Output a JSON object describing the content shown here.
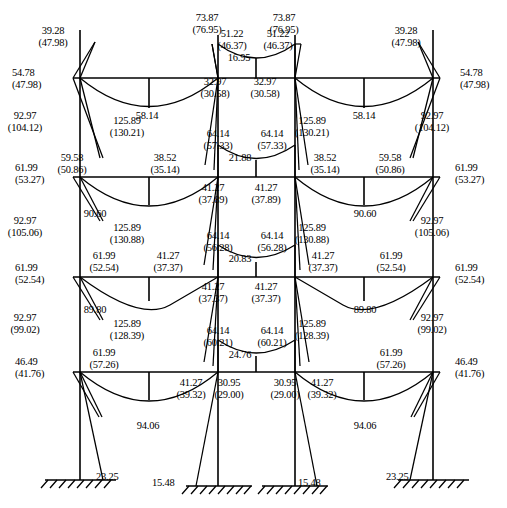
{
  "diagram": {
    "type": "bending-moment-diagram",
    "units": "kN-m",
    "geometry": {
      "columns_x": [
        80,
        218,
        295,
        433
      ],
      "floor_levels_y": [
        78,
        177,
        277,
        372
      ],
      "ground_y": [
        480,
        486,
        486,
        480
      ],
      "canvas": [
        507,
        508
      ]
    },
    "color": "#000000"
  },
  "labels": [
    {
      "id": "l-roof-left-ext-top",
      "text": "54.78\n(47.98)",
      "x": 12,
      "y": 67,
      "align": "left"
    },
    {
      "id": "l-roof-left-col-top",
      "text": "39.28\n(47.98)",
      "x": 53,
      "y": 25,
      "align": "center"
    },
    {
      "id": "l-roof-bay1-mid",
      "text": "58.14",
      "x": 147,
      "y": 110,
      "align": "center"
    },
    {
      "id": "l-roof-c2-top",
      "text": "73.87\n(76.95)",
      "x": 207,
      "y": 12,
      "align": "center"
    },
    {
      "id": "l-roof-c2-right",
      "text": "51.22\n(46.37)",
      "x": 232,
      "y": 28,
      "align": "center"
    },
    {
      "id": "l-roof-c3-left",
      "text": "51.22\n(46.37)",
      "x": 278,
      "y": 28,
      "align": "center"
    },
    {
      "id": "l-roof-midbay-sag",
      "text": "16.95",
      "x": 239,
      "y": 52,
      "align": "center"
    },
    {
      "id": "l-roof-c3-top",
      "text": "73.87\n(76.95)",
      "x": 284,
      "y": 12,
      "align": "center"
    },
    {
      "id": "l-roof-right-col-top",
      "text": "39.28\n(47.98)",
      "x": 406,
      "y": 25,
      "align": "center"
    },
    {
      "id": "l-roof-bay3-mid",
      "text": "58.14",
      "x": 364,
      "y": 110,
      "align": "center"
    },
    {
      "id": "l-roof-right-ext-top",
      "text": "54.78\n(47.98)",
      "x": 460,
      "y": 67,
      "align": "left"
    },
    {
      "id": "l-c2-below-roof",
      "text": "32.97\n(30.58)",
      "x": 215,
      "y": 76,
      "align": "center"
    },
    {
      "id": "l-c3-below-roof",
      "text": "32.97\n(30.58)",
      "x": 265,
      "y": 76,
      "align": "center"
    },
    {
      "id": "l-f2-c1-above",
      "text": "92.97\n(104.12)",
      "x": 25,
      "y": 110,
      "align": "center"
    },
    {
      "id": "l-f2-c2-above",
      "text": "125.89\n(130.21)",
      "x": 127,
      "y": 115,
      "align": "center"
    },
    {
      "id": "l-f2-c3-above",
      "text": "125.89\n(130.21)",
      "x": 312,
      "y": 115,
      "align": "center"
    },
    {
      "id": "l-f2-c4-above",
      "text": "92.97\n(104.12)",
      "x": 432,
      "y": 110,
      "align": "center"
    },
    {
      "id": "l-f2-left-ext",
      "text": "61.99\n(53.27)",
      "x": 15,
      "y": 162,
      "align": "left"
    },
    {
      "id": "l-f2-beam-left",
      "text": "59.58\n(50.86)",
      "x": 72,
      "y": 152,
      "align": "center"
    },
    {
      "id": "l-f2-beam-right1",
      "text": "38.52\n(35.14)",
      "x": 165,
      "y": 152,
      "align": "center"
    },
    {
      "id": "l-f2-mid-c2",
      "text": "64.14\n(57.33)",
      "x": 218,
      "y": 128,
      "align": "center"
    },
    {
      "id": "l-f2-mid-c3",
      "text": "64.14\n(57.33)",
      "x": 272,
      "y": 128,
      "align": "center"
    },
    {
      "id": "l-f2-mid-sag",
      "text": "21.88",
      "x": 240,
      "y": 152,
      "align": "center"
    },
    {
      "id": "l-f2-beam-right2",
      "text": "38.52\n(35.14)",
      "x": 325,
      "y": 152,
      "align": "center"
    },
    {
      "id": "l-f2-beam-right3",
      "text": "59.58\n(50.86)",
      "x": 390,
      "y": 152,
      "align": "center"
    },
    {
      "id": "l-f2-right-ext",
      "text": "61.99\n(53.27)",
      "x": 455,
      "y": 162,
      "align": "left"
    },
    {
      "id": "l-f2-bay1-mid",
      "text": "90.60",
      "x": 95,
      "y": 208,
      "align": "center"
    },
    {
      "id": "l-f2-bay3-mid",
      "text": "90.60",
      "x": 365,
      "y": 208,
      "align": "center"
    },
    {
      "id": "l-f2-c2-below",
      "text": "41.27\n(37.89)",
      "x": 213,
      "y": 182,
      "align": "center"
    },
    {
      "id": "l-f2-c3-below",
      "text": "41.27\n(37.89)",
      "x": 266,
      "y": 182,
      "align": "center"
    },
    {
      "id": "l-f3-c1-above",
      "text": "92.97\n(105.06)",
      "x": 25,
      "y": 215,
      "align": "center"
    },
    {
      "id": "l-f3-c2-above",
      "text": "125.89\n(130.88)",
      "x": 127,
      "y": 222,
      "align": "center"
    },
    {
      "id": "l-f3-c3-above",
      "text": "125.89\n(130.88)",
      "x": 312,
      "y": 222,
      "align": "center"
    },
    {
      "id": "l-f3-c4-above",
      "text": "92.97\n(105.06)",
      "x": 432,
      "y": 215,
      "align": "center"
    },
    {
      "id": "l-f3-left-ext",
      "text": "61.99\n(52.54)",
      "x": 15,
      "y": 262,
      "align": "left"
    },
    {
      "id": "l-f3-beam-left",
      "text": "61.99\n(52.54)",
      "x": 104,
      "y": 250,
      "align": "center"
    },
    {
      "id": "l-f3-beam-right1",
      "text": "41.27\n(37.37)",
      "x": 168,
      "y": 250,
      "align": "center"
    },
    {
      "id": "l-f3-mid-c2",
      "text": "64.14\n(56.28)",
      "x": 218,
      "y": 230,
      "align": "center"
    },
    {
      "id": "l-f3-mid-c3",
      "text": "64.14\n(56.28)",
      "x": 272,
      "y": 230,
      "align": "center"
    },
    {
      "id": "l-f3-mid-sag",
      "text": "20.83",
      "x": 240,
      "y": 253,
      "align": "center"
    },
    {
      "id": "l-f3-beam-right2",
      "text": "41.27\n(37.37)",
      "x": 323,
      "y": 250,
      "align": "center"
    },
    {
      "id": "l-f3-beam-right3",
      "text": "61.99\n(52.54)",
      "x": 391,
      "y": 250,
      "align": "center"
    },
    {
      "id": "l-f3-right-ext",
      "text": "61.99\n(52.54)",
      "x": 455,
      "y": 262,
      "align": "left"
    },
    {
      "id": "l-f3-bay1-mid",
      "text": "89.80",
      "x": 95,
      "y": 304,
      "align": "center"
    },
    {
      "id": "l-f3-bay3-mid",
      "text": "89.80",
      "x": 365,
      "y": 304,
      "align": "center"
    },
    {
      "id": "l-f3-c2-below",
      "text": "41.27\n(37.37)",
      "x": 213,
      "y": 281,
      "align": "center"
    },
    {
      "id": "l-f3-c3-below",
      "text": "41.27\n(37.37)",
      "x": 266,
      "y": 281,
      "align": "center"
    },
    {
      "id": "l-f4-c1-above",
      "text": "92.97\n(99.02)",
      "x": 25,
      "y": 312,
      "align": "center"
    },
    {
      "id": "l-f4-c2-above",
      "text": "125.89\n(128.39)",
      "x": 127,
      "y": 318,
      "align": "center"
    },
    {
      "id": "l-f4-c3-above",
      "text": "125.89\n(128.39)",
      "x": 312,
      "y": 318,
      "align": "center"
    },
    {
      "id": "l-f4-c4-above",
      "text": "92.97\n(99.02)",
      "x": 432,
      "y": 312,
      "align": "center"
    },
    {
      "id": "l-f4-left-ext",
      "text": "46.49\n(41.76)",
      "x": 15,
      "y": 356,
      "align": "left"
    },
    {
      "id": "l-f4-beam-left",
      "text": "61.99\n(57.26)",
      "x": 104,
      "y": 347,
      "align": "center"
    },
    {
      "id": "l-f4-mid-c2",
      "text": "64.14\n(60.21)",
      "x": 218,
      "y": 325,
      "align": "center"
    },
    {
      "id": "l-f4-mid-c3",
      "text": "64.14\n(60.21)",
      "x": 272,
      "y": 325,
      "align": "center"
    },
    {
      "id": "l-f4-mid-sag",
      "text": "24.76",
      "x": 240,
      "y": 349,
      "align": "center"
    },
    {
      "id": "l-f4-beam-right3",
      "text": "61.99\n(57.26)",
      "x": 391,
      "y": 347,
      "align": "center"
    },
    {
      "id": "l-f4-right-ext",
      "text": "46.49\n(41.76)",
      "x": 455,
      "y": 356,
      "align": "left"
    },
    {
      "id": "l-f4-c2l-below",
      "text": "41.27\n(39.32)",
      "x": 191,
      "y": 377,
      "align": "center"
    },
    {
      "id": "l-f4-c2-below",
      "text": "30.95\n(29.00)",
      "x": 229,
      "y": 377,
      "align": "center"
    },
    {
      "id": "l-f4-c3-below",
      "text": "30.95\n(29.00)",
      "x": 285,
      "y": 377,
      "align": "center"
    },
    {
      "id": "l-f4-c3r-below",
      "text": "41.27\n(39.32)",
      "x": 322,
      "y": 377,
      "align": "center"
    },
    {
      "id": "l-f4-bay1-mid",
      "text": "94.06",
      "x": 148,
      "y": 420,
      "align": "center"
    },
    {
      "id": "l-f4-bay3-mid",
      "text": "94.06",
      "x": 365,
      "y": 420,
      "align": "center"
    },
    {
      "id": "l-base-c1",
      "text": "23.25",
      "x": 96,
      "y": 471,
      "align": "left"
    },
    {
      "id": "l-base-c2",
      "text": "15.48",
      "x": 152,
      "y": 477,
      "align": "left"
    },
    {
      "id": "l-base-c3",
      "text": "15.48",
      "x": 298,
      "y": 477,
      "align": "left"
    },
    {
      "id": "l-base-c4",
      "text": "23.25",
      "x": 386,
      "y": 471,
      "align": "left"
    }
  ],
  "chart_data": {
    "type": "line",
    "xlabel": "Frame span",
    "ylabel": "Bending moment (kN-m)",
    "series": [
      {
        "name": "Roof level",
        "points": [
          {
            "loc": "left-exterior-joint",
            "value": 54.78,
            "alt": 47.98
          },
          {
            "loc": "col1-top",
            "value": 39.28,
            "alt": 47.98
          },
          {
            "loc": "bay1-midspan",
            "value": 58.14,
            "alt": null
          },
          {
            "loc": "col2-top",
            "value": 73.87,
            "alt": 76.95
          },
          {
            "loc": "col2-right-mid-bay",
            "value": 51.22,
            "alt": 46.37
          },
          {
            "loc": "mid-bay-sag",
            "value": 16.95,
            "alt": null
          },
          {
            "loc": "col3-left-mid-bay",
            "value": 51.22,
            "alt": 46.37
          },
          {
            "loc": "col3-top",
            "value": 73.87,
            "alt": 76.95
          },
          {
            "loc": "bay3-midspan",
            "value": 58.14,
            "alt": null
          },
          {
            "loc": "col4-top",
            "value": 39.28,
            "alt": 47.98
          },
          {
            "loc": "right-exterior-joint",
            "value": 54.78,
            "alt": 47.98
          },
          {
            "loc": "col2-below-roof",
            "value": 32.97,
            "alt": 30.58
          },
          {
            "loc": "col3-below-roof",
            "value": 32.97,
            "alt": 30.58
          }
        ]
      },
      {
        "name": "Floor 3 (2nd level)",
        "points": [
          {
            "loc": "col1-above",
            "value": 92.97,
            "alt": 104.12
          },
          {
            "loc": "col2-above",
            "value": 125.89,
            "alt": 130.21
          },
          {
            "loc": "col3-above",
            "value": 125.89,
            "alt": 130.21
          },
          {
            "loc": "col4-above",
            "value": 92.97,
            "alt": 104.12
          },
          {
            "loc": "left-exterior-joint",
            "value": 61.99,
            "alt": 53.27
          },
          {
            "loc": "beam1-left-end",
            "value": 59.58,
            "alt": 50.86
          },
          {
            "loc": "beam1-right-end",
            "value": 38.52,
            "alt": 35.14
          },
          {
            "loc": "bay1-midspan",
            "value": 90.6,
            "alt": null
          },
          {
            "loc": "midbay-left-end",
            "value": 64.14,
            "alt": 57.33
          },
          {
            "loc": "midbay-sag",
            "value": 21.88,
            "alt": null
          },
          {
            "loc": "midbay-right-end",
            "value": 64.14,
            "alt": 57.33
          },
          {
            "loc": "beam3-left-end",
            "value": 38.52,
            "alt": 35.14
          },
          {
            "loc": "beam3-right-end",
            "value": 59.58,
            "alt": 50.86
          },
          {
            "loc": "bay3-midspan",
            "value": 90.6,
            "alt": null
          },
          {
            "loc": "right-exterior-joint",
            "value": 61.99,
            "alt": 53.27
          },
          {
            "loc": "col2-below",
            "value": 41.27,
            "alt": 37.89
          },
          {
            "loc": "col3-below",
            "value": 41.27,
            "alt": 37.89
          }
        ]
      },
      {
        "name": "Floor 2 (3rd level)",
        "points": [
          {
            "loc": "col1-above",
            "value": 92.97,
            "alt": 105.06
          },
          {
            "loc": "col2-above",
            "value": 125.89,
            "alt": 130.88
          },
          {
            "loc": "col3-above",
            "value": 125.89,
            "alt": 130.88
          },
          {
            "loc": "col4-above",
            "value": 92.97,
            "alt": 105.06
          },
          {
            "loc": "left-exterior-joint",
            "value": 61.99,
            "alt": 52.54
          },
          {
            "loc": "beam1-left-end",
            "value": 61.99,
            "alt": 52.54
          },
          {
            "loc": "beam1-right-end",
            "value": 41.27,
            "alt": 37.37
          },
          {
            "loc": "bay1-midspan",
            "value": 89.8,
            "alt": null
          },
          {
            "loc": "midbay-left-end",
            "value": 64.14,
            "alt": 56.28
          },
          {
            "loc": "midbay-sag",
            "value": 20.83,
            "alt": null
          },
          {
            "loc": "midbay-right-end",
            "value": 64.14,
            "alt": 56.28
          },
          {
            "loc": "beam3-left-end",
            "value": 41.27,
            "alt": 37.37
          },
          {
            "loc": "beam3-right-end",
            "value": 61.99,
            "alt": 52.54
          },
          {
            "loc": "bay3-midspan",
            "value": 89.8,
            "alt": null
          },
          {
            "loc": "right-exterior-joint",
            "value": 61.99,
            "alt": 52.54
          },
          {
            "loc": "col2-below",
            "value": 41.27,
            "alt": 37.37
          },
          {
            "loc": "col3-below",
            "value": 41.27,
            "alt": 37.37
          }
        ]
      },
      {
        "name": "Floor 1 (ground level beam)",
        "points": [
          {
            "loc": "col1-above",
            "value": 92.97,
            "alt": 99.02
          },
          {
            "loc": "col2-above",
            "value": 125.89,
            "alt": 128.39
          },
          {
            "loc": "col3-above",
            "value": 125.89,
            "alt": 128.39
          },
          {
            "loc": "col4-above",
            "value": 92.97,
            "alt": 99.02
          },
          {
            "loc": "left-exterior-joint",
            "value": 46.49,
            "alt": 41.76
          },
          {
            "loc": "beam1-left-end",
            "value": 61.99,
            "alt": 57.26
          },
          {
            "loc": "bay1-midspan",
            "value": 94.06,
            "alt": null
          },
          {
            "loc": "midbay-left-end",
            "value": 64.14,
            "alt": 60.21
          },
          {
            "loc": "midbay-sag",
            "value": 24.76,
            "alt": null
          },
          {
            "loc": "midbay-right-end",
            "value": 64.14,
            "alt": 60.21
          },
          {
            "loc": "beam3-right-end",
            "value": 61.99,
            "alt": 57.26
          },
          {
            "loc": "bay3-midspan",
            "value": 94.06,
            "alt": null
          },
          {
            "loc": "right-exterior-joint",
            "value": 46.49,
            "alt": 41.76
          },
          {
            "loc": "col2-left-below",
            "value": 41.27,
            "alt": 39.32
          },
          {
            "loc": "col2-below",
            "value": 30.95,
            "alt": 29.0
          },
          {
            "loc": "col3-below",
            "value": 30.95,
            "alt": 29.0
          },
          {
            "loc": "col3-right-below",
            "value": 41.27,
            "alt": 39.32
          }
        ]
      },
      {
        "name": "Base supports",
        "points": [
          {
            "loc": "col1-base",
            "value": 23.25,
            "alt": null
          },
          {
            "loc": "col2-base",
            "value": 15.48,
            "alt": null
          },
          {
            "loc": "col3-base",
            "value": 15.48,
            "alt": null
          },
          {
            "loc": "col4-base",
            "value": 23.25,
            "alt": null
          }
        ]
      }
    ]
  }
}
